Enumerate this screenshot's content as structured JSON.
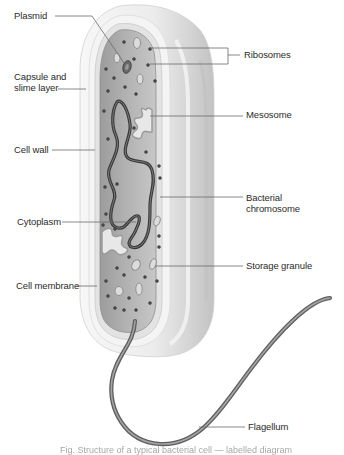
{
  "diagram": {
    "colors": {
      "background": "#ffffff",
      "capsule": "#f2f2f2",
      "capsule_shadow": "#cfcfcf",
      "cell_wall": "#e6e6e6",
      "cytoplasm": "#a9a9a9",
      "cytoplasm_light": "#c4c4c4",
      "chromosome": "#3e3e3e",
      "ribosome": "#4a4a4a",
      "granule": "#d9d9d9",
      "leader_line": "#6a6a6a",
      "label_text": "#2b2b2b"
    },
    "labels": [
      {
        "id": "plasmid",
        "text": "Plasmid",
        "x": 14,
        "y": 10,
        "line": [
          [
            55,
            16
          ],
          [
            92,
            16
          ],
          [
            124,
            63
          ]
        ]
      },
      {
        "id": "ribosomes",
        "text": "Ribosomes",
        "x": 244,
        "y": 49,
        "line": [
          [
            228,
            55
          ],
          [
            240,
            55
          ]
        ],
        "bracket": [
          [
            150,
            48
          ],
          [
            228,
            48
          ],
          [
            228,
            64
          ],
          [
            150,
            64
          ]
        ]
      },
      {
        "id": "capsule-slime-layer",
        "text": "Capsule and\nslime layer",
        "x": 14,
        "y": 71,
        "line": [
          [
            58,
            89
          ],
          [
            86,
            89
          ]
        ]
      },
      {
        "id": "mesosome",
        "text": "Mesosome",
        "x": 246,
        "y": 109,
        "line": [
          [
            150,
            116
          ],
          [
            243,
            116
          ]
        ]
      },
      {
        "id": "cell-wall",
        "text": "Cell wall",
        "x": 14,
        "y": 144,
        "line": [
          [
            52,
            150
          ],
          [
            95,
            150
          ]
        ]
      },
      {
        "id": "bacterial-chromosome",
        "text": "Bacterial\nchromosome",
        "x": 246,
        "y": 192,
        "line": [
          [
            160,
            197
          ],
          [
            243,
            197
          ]
        ]
      },
      {
        "id": "cytoplasm",
        "text": "Cytoplasm",
        "x": 17,
        "y": 216,
        "line": [
          [
            62,
            222
          ],
          [
            136,
            222
          ]
        ]
      },
      {
        "id": "storage-granule",
        "text": "Storage granule",
        "x": 246,
        "y": 260,
        "line": [
          [
            155,
            266
          ],
          [
            243,
            266
          ]
        ]
      },
      {
        "id": "cell-membrane",
        "text": "Cell membrane",
        "x": 16,
        "y": 280,
        "line": [
          [
            76,
            286
          ],
          [
            97,
            286
          ]
        ]
      },
      {
        "id": "flagellum",
        "text": "Flagellum",
        "x": 248,
        "y": 421,
        "line": [
          [
            199,
            427
          ],
          [
            245,
            427
          ]
        ]
      }
    ],
    "caption": "Fig. Structure of a typical bacterial cell — labelled diagram"
  }
}
